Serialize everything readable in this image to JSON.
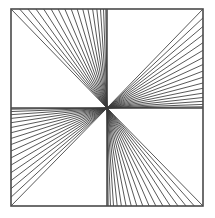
{
  "figure": {
    "background_color": "#ffffff",
    "line_color": "#3a3a3a",
    "frame_color": "#4a4a4a",
    "frame_stroke_width": 1.6,
    "ray_stroke_width": 0.85,
    "canvas": {
      "width": 215,
      "height": 218
    },
    "frame": {
      "left": 11,
      "top": 9,
      "right": 203,
      "bottom": 206
    },
    "center": {
      "x": 107,
      "y": 108
    },
    "axes": {
      "vertical_line_x": 107,
      "horizontal_line_y": 108,
      "vertical_visible_segments": [
        "top",
        "bottom"
      ],
      "horizontal_visible_segments": [
        "left",
        "right"
      ]
    },
    "fans": [
      {
        "name": "top-left-fan",
        "quadrant": "top-left",
        "terminating_edge": "top",
        "ray_count": 17,
        "edge_span": {
          "from_x": 11,
          "to_x": 107
        },
        "includes_corner_diagonal": true
      },
      {
        "name": "top-right-fan",
        "quadrant": "top-right",
        "terminating_edge": "right",
        "ray_count": 17,
        "edge_span": {
          "from_y": 9,
          "to_y": 108
        },
        "includes_corner_diagonal": true
      },
      {
        "name": "bottom-right-fan",
        "quadrant": "bottom-right",
        "terminating_edge": "bottom",
        "ray_count": 17,
        "edge_span": {
          "from_x": 203,
          "to_x": 107
        },
        "includes_corner_diagonal": true
      },
      {
        "name": "bottom-left-fan",
        "quadrant": "bottom-left",
        "terminating_edge": "left",
        "ray_count": 17,
        "edge_span": {
          "from_y": 206,
          "to_y": 108
        },
        "includes_corner_diagonal": true
      }
    ]
  }
}
